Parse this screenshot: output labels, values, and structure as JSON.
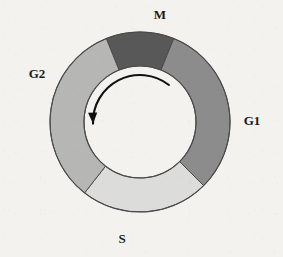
{
  "figure": {
    "background_color": "#f3f2ef",
    "outline_color": "#4a4a4a"
  },
  "chart_data": {
    "type": "pie",
    "variant": "donut",
    "title": "",
    "subtitle": "",
    "xlabel": "",
    "ylabel": "",
    "legend_position": "none",
    "grid": false,
    "center_x": 140,
    "center_y": 122,
    "outer_radius": 90,
    "inner_radius": 56,
    "direction": "counterclockwise",
    "categories": [
      "M",
      "G1",
      "S",
      "G2"
    ],
    "values": [
      12.2,
      31.4,
      23.1,
      33.3
    ],
    "labels": [
      "M",
      "G1",
      "S",
      "G2"
    ],
    "colors": [
      "#585858",
      "#8c8c8c",
      "#dcdcda",
      "#b6b6b4"
    ],
    "segments": [
      {
        "name": "M",
        "label": "M",
        "color": "#585858",
        "start_angle_deg": -22,
        "end_angle_deg": 22,
        "sweep_deg": 44,
        "percent": 12.2,
        "label_x": 160,
        "label_y": 19,
        "label_anchor": "middle"
      },
      {
        "name": "G1",
        "label": "G1",
        "color": "#8c8c8c",
        "start_angle_deg": 22,
        "end_angle_deg": 135,
        "sweep_deg": 113,
        "percent": 31.4,
        "label_x": 252,
        "label_y": 125,
        "label_anchor": "middle"
      },
      {
        "name": "S",
        "label": "S",
        "color": "#dcdcda",
        "start_angle_deg": 135,
        "end_angle_deg": 218,
        "sweep_deg": 83,
        "percent": 23.1,
        "label_x": 122,
        "label_y": 243,
        "label_anchor": "middle"
      },
      {
        "name": "G2",
        "label": "G2",
        "color": "#b6b6b4",
        "start_angle_deg": 218,
        "end_angle_deg": 338,
        "sweep_deg": 120,
        "percent": 33.3,
        "label_x": 37,
        "label_y": 78,
        "label_anchor": "middle"
      }
    ],
    "annotations": [
      {
        "name": "cycle-direction-arrow",
        "type": "curved-arrow",
        "direction": "counterclockwise",
        "color": "#111111",
        "radius": 47,
        "start_angle_deg": 38,
        "end_angle_deg": 268,
        "arrowhead_x": 114,
        "arrowhead_y": 178
      }
    ]
  }
}
